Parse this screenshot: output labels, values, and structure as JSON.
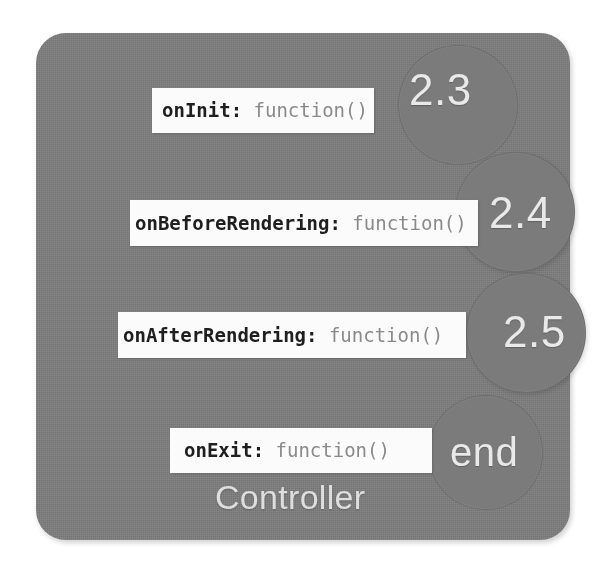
{
  "diagram": {
    "caption": "Controller",
    "panel_color": "#7d7d7d",
    "box_color": "#fbfbfb",
    "label_color": "#e9e9e9",
    "hook_text_color": "#1f1f1f",
    "fn_text_color": "#8a8a8a",
    "steps": [
      {
        "id": "on-init",
        "hook": "onInit:",
        "fn": " function()",
        "bubble_label": "2.3"
      },
      {
        "id": "on-before-rendering",
        "hook": "onBeforeRendering:",
        "fn": " function()",
        "bubble_label": "2.4"
      },
      {
        "id": "on-after-rendering",
        "hook": "onAfterRendering:",
        "fn": " function()",
        "bubble_label": "2.5"
      },
      {
        "id": "on-exit",
        "hook": "onExit:",
        "fn": " function()",
        "bubble_label": "end"
      }
    ]
  }
}
